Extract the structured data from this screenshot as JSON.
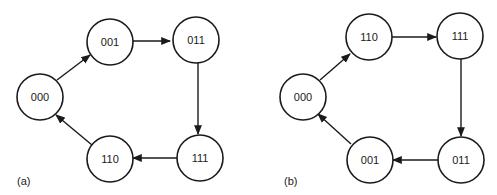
{
  "diagram": {
    "panels": [
      {
        "label": "(a)",
        "nodes": [
          {
            "id": "a0",
            "text": "000"
          },
          {
            "id": "a1",
            "text": "001"
          },
          {
            "id": "a2",
            "text": "011"
          },
          {
            "id": "a3",
            "text": "111"
          },
          {
            "id": "a4",
            "text": "110"
          }
        ],
        "edges": [
          {
            "from": "000",
            "to": "001"
          },
          {
            "from": "001",
            "to": "011"
          },
          {
            "from": "011",
            "to": "111"
          },
          {
            "from": "111",
            "to": "110"
          },
          {
            "from": "110",
            "to": "000"
          }
        ]
      },
      {
        "label": "(b)",
        "nodes": [
          {
            "id": "b0",
            "text": "000"
          },
          {
            "id": "b1",
            "text": "110"
          },
          {
            "id": "b2",
            "text": "111"
          },
          {
            "id": "b3",
            "text": "011"
          },
          {
            "id": "b4",
            "text": "001"
          }
        ],
        "edges": [
          {
            "from": "000",
            "to": "110"
          },
          {
            "from": "110",
            "to": "111"
          },
          {
            "from": "111",
            "to": "011"
          },
          {
            "from": "011",
            "to": "001"
          },
          {
            "from": "001",
            "to": "000"
          }
        ]
      }
    ]
  }
}
